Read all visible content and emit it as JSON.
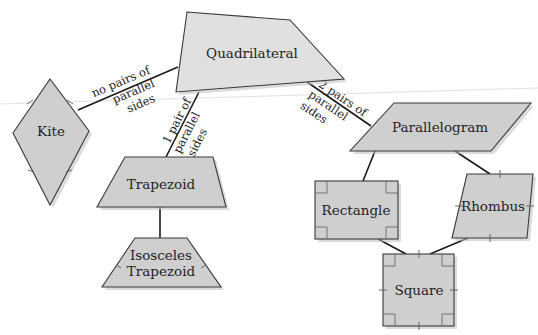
{
  "diagram": {
    "colors": {
      "shape_fill_light": "#e0e0e0",
      "shape_fill_mid": "#cfcfcf",
      "outline": "#3a3a3a",
      "connector": "#1a1a1a",
      "text": "#222222"
    },
    "nodes": {
      "quadrilateral": {
        "label": "Quadrilateral"
      },
      "kite": {
        "label": "Kite"
      },
      "trapezoid": {
        "label": "Trapezoid"
      },
      "isosceles_trapezoid": {
        "label_line1": "Isosceles",
        "label_line2": "Trapezoid"
      },
      "parallelogram": {
        "label": "Parallelogram"
      },
      "rectangle": {
        "label": "Rectangle"
      },
      "rhombus": {
        "label": "Rhombus"
      },
      "square": {
        "label": "Square"
      }
    },
    "edges": {
      "quad_to_kite": {
        "line1": "no pairs of",
        "line2": "parallel",
        "line3": "sides"
      },
      "quad_to_trapezoid": {
        "line1": "1 pair of",
        "line2": "parallel",
        "line3": "sides"
      },
      "quad_to_parallelogram": {
        "line1": "2 pairs of",
        "line2": "parallel",
        "line3": "sides"
      },
      "trapezoid_to_isosceles": {},
      "parallelogram_to_rectangle": {},
      "parallelogram_to_rhombus": {},
      "rectangle_to_square": {},
      "rhombus_to_square": {}
    }
  }
}
